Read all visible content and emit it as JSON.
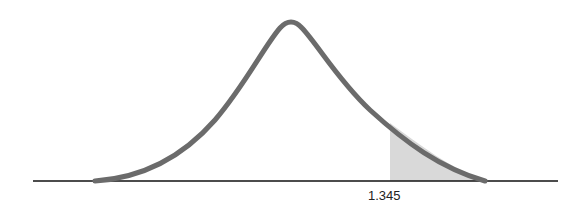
{
  "diagram": {
    "type": "t-distribution curve with shaded right tail",
    "critical_value_label": "1.345",
    "colors": {
      "curve": "#6b6b6b",
      "shade": "#d9d9d9",
      "axis": "#111111"
    }
  }
}
